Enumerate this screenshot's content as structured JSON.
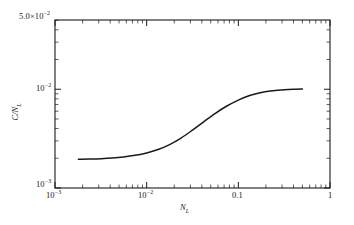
{
  "chart_data": {
    "type": "line",
    "title": "",
    "xlabel": "N_L",
    "ylabel": "C/N_L",
    "xscale": "log",
    "yscale": "log",
    "xlim": [
      0.001,
      1
    ],
    "ylim": [
      0.001,
      0.05
    ],
    "grid": false,
    "legend": null,
    "series": [
      {
        "name": "C/N_L",
        "x": [
          0.0018,
          0.0024,
          0.0032,
          0.0042,
          0.0056,
          0.0075,
          0.01,
          0.0133,
          0.0178,
          0.0237,
          0.0316,
          0.0422,
          0.0562,
          0.075,
          0.1,
          0.133,
          0.178,
          0.237,
          0.316,
          0.422,
          0.5
        ],
        "y": [
          0.00195,
          0.00196,
          0.00198,
          0.00201,
          0.00206,
          0.00214,
          0.00226,
          0.00245,
          0.00275,
          0.0032,
          0.00385,
          0.0047,
          0.0057,
          0.00675,
          0.00775,
          0.00862,
          0.00925,
          0.00965,
          0.00988,
          0.00998,
          0.01
        ]
      }
    ]
  },
  "axes": {
    "corner_label": {
      "mantissa": "5.0",
      "times": "×",
      "base": "10",
      "exponent": "−2"
    },
    "y_ticks": [
      {
        "base": "10",
        "exponent": "−2",
        "value": 0.01
      },
      {
        "base": "10",
        "exponent": "−3",
        "value": 0.001
      }
    ],
    "x_ticks": [
      {
        "text": "10",
        "exponent": "−3",
        "value": 0.001
      },
      {
        "text": "10",
        "exponent": "−2",
        "value": 0.01
      },
      {
        "text": "0.1",
        "exponent": "",
        "value": 0.1
      },
      {
        "text": "1",
        "exponent": "",
        "value": 1
      }
    ],
    "x_axis_title": {
      "symbol": "N",
      "subscript": "L"
    },
    "y_axis_title": {
      "numerator": "C",
      "slash": "/",
      "denominator": "N",
      "subscript": "L"
    }
  },
  "style": {
    "curve_color": "#1a1a1a",
    "axis_color": "#1a1a1a",
    "background": "#ffffff"
  }
}
